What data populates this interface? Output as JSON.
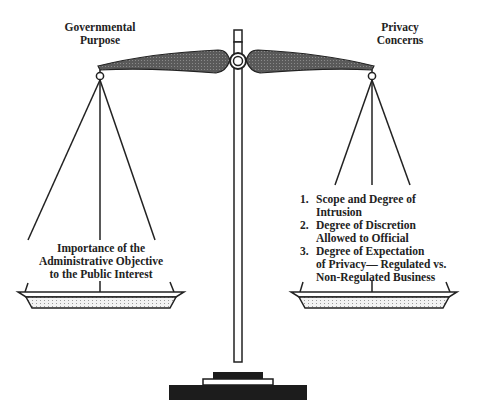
{
  "diagram": {
    "type": "balance-scale",
    "left_side": {
      "title_lines": [
        "Governmental",
        "Purpose"
      ],
      "pan_text_lines": [
        "Importance of the",
        "Administrative Objective",
        "to the Public Interest"
      ]
    },
    "right_side": {
      "title_lines": [
        "Privacy",
        "Concerns"
      ],
      "items": [
        {
          "number": "1.",
          "lines": [
            "Scope and Degree of",
            "Intrusion"
          ]
        },
        {
          "number": "2.",
          "lines": [
            "Degree of Discretion",
            "Allowed to Official"
          ]
        },
        {
          "number": "3.",
          "lines": [
            "Degree of Expectation",
            "of Privacy— Regulated vs.",
            "Non-Regulated Business"
          ]
        }
      ]
    },
    "colors": {
      "beam_fill": "#4a4a4a",
      "line": "#222222",
      "base": "#1c1c1c",
      "pan_fill": "#e8e8e8"
    }
  }
}
